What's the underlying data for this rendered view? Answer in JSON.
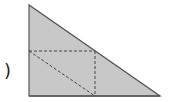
{
  "label": {
    "paren": ")"
  },
  "colors": {
    "fill": "#c8c8c8",
    "stroke": "#555555",
    "dashed": "#444444",
    "background": "#ffffff"
  },
  "triangle": {
    "points": "29,5 29,96 160,96"
  },
  "dashed_lines": {
    "horizontal": {
      "x1": 29,
      "y1": 51,
      "x2": 95,
      "y2": 51
    },
    "vertical": {
      "x1": 95,
      "y1": 51,
      "x2": 95,
      "y2": 96
    },
    "diagonal": {
      "x1": 29,
      "y1": 51,
      "x2": 95,
      "y2": 96
    }
  }
}
